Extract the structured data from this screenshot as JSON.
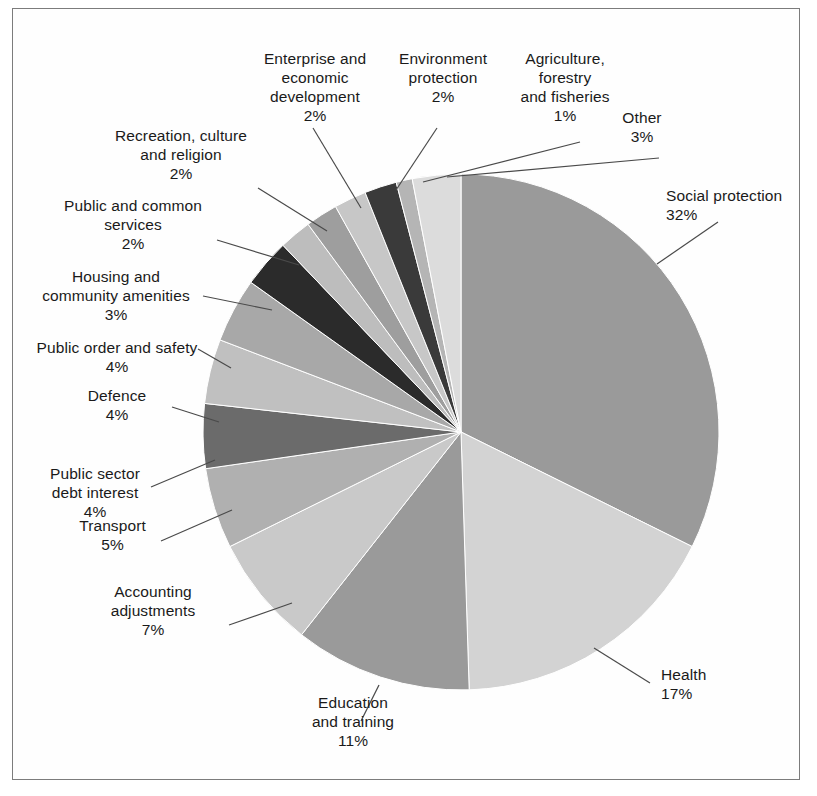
{
  "figure": {
    "title": "",
    "border_color": "#7c7c7c",
    "background": "#ffffff"
  },
  "chart_data": {
    "type": "pie",
    "title": "",
    "xlabel": "",
    "ylabel": "",
    "legend_position": "callout-labels",
    "grid": false,
    "start_angle_deg": 0,
    "direction": "clockwise",
    "units": "percent",
    "categories": [
      "Social protection",
      "Health",
      "Education and training",
      "Accounting adjustments",
      "Transport",
      "Public sector debt interest",
      "Defence",
      "Public order and safety",
      "Housing and community amenities",
      "Public and common services",
      "Recreation, culture and religion",
      "Enterprise and economic development",
      "Environment protection",
      "Agriculture, forestry and fisheries",
      "Other"
    ],
    "values": [
      32,
      17,
      11,
      7,
      5,
      4,
      4,
      4,
      3,
      2,
      2,
      2,
      2,
      1,
      3
    ],
    "value_labels": [
      "32%",
      "17%",
      "11%",
      "7%",
      "5%",
      "4%",
      "4%",
      "4%",
      "3%",
      "2%",
      "2%",
      "2%",
      "2%",
      "1%",
      "3%"
    ],
    "colors": [
      "#9a9a9a",
      "#d3d3d3",
      "#9a9a9a",
      "#c9c9c9",
      "#b0b0b0",
      "#6b6b6b",
      "#c0c0c0",
      "#a8a8a8",
      "#2b2b2b",
      "#bdbdbd",
      "#9e9e9e",
      "#c7c7c7",
      "#3a3a3a",
      "#b5b5b5",
      "#dcdcdc"
    ]
  },
  "slices": [
    {
      "name": "Social protection",
      "percent_label": "32%",
      "label_line1": "Social protection",
      "label_line2": "32%"
    },
    {
      "name": "Health",
      "percent_label": "17%",
      "label_line1": "Health",
      "label_line2": "17%"
    },
    {
      "name": "Education and training",
      "percent_label": "11%",
      "label_line1": "Education",
      "label_line2": "and training",
      "label_line3": "11%"
    },
    {
      "name": "Accounting adjustments",
      "percent_label": "7%",
      "label_line1": "Accounting",
      "label_line2": "adjustments",
      "label_line3": "7%"
    },
    {
      "name": "Transport",
      "percent_label": "5%",
      "label_line1": "Transport",
      "label_line2": "5%"
    },
    {
      "name": "Public sector debt interest",
      "percent_label": "4%",
      "label_line1": "Public sector",
      "label_line2": "debt interest",
      "label_line3": "4%"
    },
    {
      "name": "Defence",
      "percent_label": "4%",
      "label_line1": "Defence",
      "label_line2": "4%"
    },
    {
      "name": "Public order and safety",
      "percent_label": "4%",
      "label_line1": "Public order and safety",
      "label_line2": "4%"
    },
    {
      "name": "Housing and community amenities",
      "percent_label": "3%",
      "label_line1": "Housing and",
      "label_line2": "community amenities",
      "label_line3": "3%"
    },
    {
      "name": "Public and common services",
      "percent_label": "2%",
      "label_line1": "Public and common",
      "label_line2": "services",
      "label_line3": "2%"
    },
    {
      "name": "Recreation, culture and religion",
      "percent_label": "2%",
      "label_line1": "Recreation, culture",
      "label_line2": "and religion",
      "label_line3": "2%"
    },
    {
      "name": "Enterprise and economic development",
      "percent_label": "2%",
      "label_line1": "Enterprise and",
      "label_line2": "economic",
      "label_line3": "development",
      "label_line4": "2%"
    },
    {
      "name": "Environment protection",
      "percent_label": "2%",
      "label_line1": "Environment",
      "label_line2": "protection",
      "label_line3": "2%"
    },
    {
      "name": "Agriculture, forestry and fisheries",
      "percent_label": "1%",
      "label_line1": "Agriculture,",
      "label_line2": "forestry",
      "label_line3": "and fisheries",
      "label_line4": "1%"
    },
    {
      "name": "Other",
      "percent_label": "3%",
      "label_line1": "Other",
      "label_line2": "3%"
    }
  ],
  "callouts": {
    "social_protection": "Social protection\n32%",
    "health": "Health\n17%",
    "education_and_training": "Education\nand training\n11%",
    "accounting_adjustments": "Accounting\nadjustments\n7%",
    "transport": "Transport\n5%",
    "public_sector_debt_interest": "Public sector\ndebt interest\n4%",
    "defence": "Defence\n4%",
    "public_order_and_safety": "Public order and safety\n4%",
    "housing_and_community_amenities": "Housing and\ncommunity amenities\n3%",
    "public_and_common_services": "Public and common\nservices\n2%",
    "recreation_culture_and_religion": "Recreation, culture\nand religion\n2%",
    "enterprise_and_economic_development": "Enterprise and\neconomic\ndevelopment\n2%",
    "environment_protection": "Environment\nprotection\n2%",
    "agriculture_forestry_and_fisheries": "Agriculture,\nforestry\nand fisheries\n1%",
    "other": "Other\n3%"
  }
}
